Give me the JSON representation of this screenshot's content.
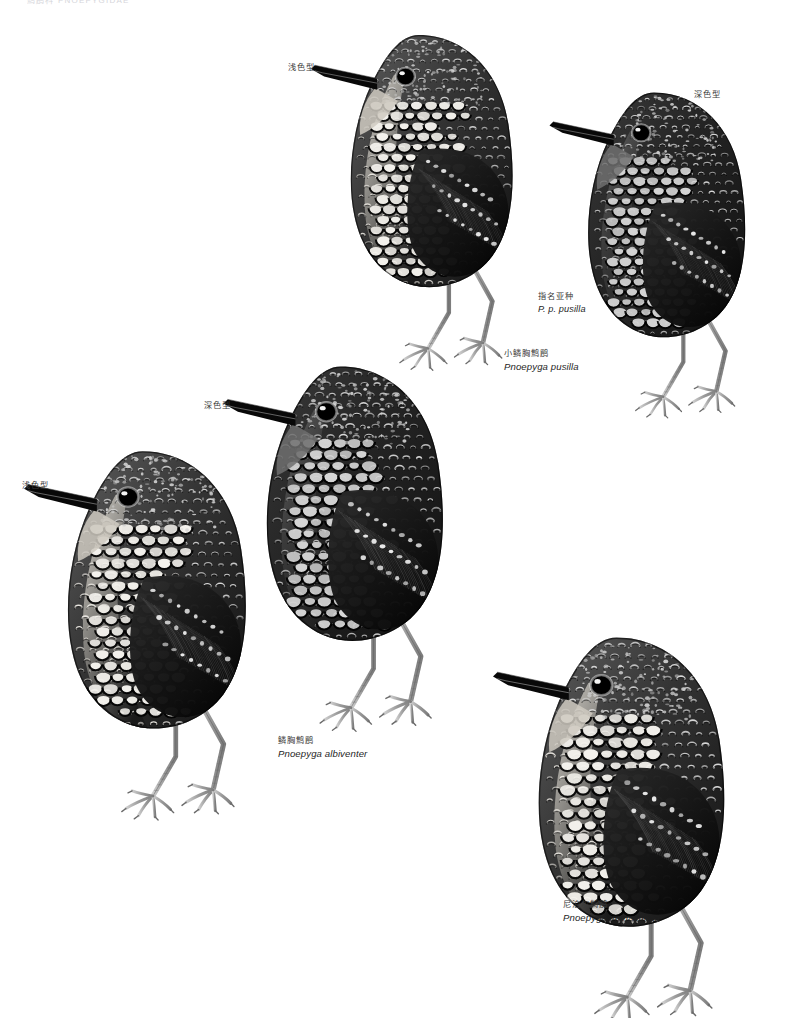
{
  "page": {
    "width": 792,
    "height": 1018,
    "background": "#ffffff",
    "running_header": "鹪鹛科 PNOEPYGIDAE"
  },
  "plate": {
    "type": "field-guide-illustration-plate",
    "medium": "grayscale-scientific-illustration",
    "subject": "wren-babblers (Pnoepyga)",
    "ink_color": "#1a1a1a",
    "leg_color": "#9a9a9a"
  },
  "birds": [
    {
      "id": "pusilla-pale",
      "species_key": "pusilla",
      "morph_label": "浅色型",
      "morph_label_en_meaning": "pale morph",
      "facing": "left",
      "plumage": "pale",
      "position": {
        "left": 300,
        "top": 18,
        "width": 260,
        "height": 340
      },
      "label_position": {
        "left": 288,
        "top": 63
      }
    },
    {
      "id": "pusilla-dark",
      "species_key": "pusilla",
      "morph_label": "深色型",
      "morph_label_en_meaning": "dark morph",
      "facing": "left",
      "plumage": "dark",
      "position": {
        "left": 545,
        "top": 76,
        "width": 240,
        "height": 330
      },
      "label_position": {
        "left": 694,
        "top": 90
      }
    },
    {
      "id": "albiventer-dark",
      "species_key": "albiventer",
      "morph_label": "深色型",
      "morph_label_en_meaning": "dark morph",
      "facing": "left",
      "plumage": "dark",
      "position": {
        "left": 218,
        "top": 348,
        "width": 270,
        "height": 370
      },
      "label_position": {
        "left": 204,
        "top": 401
      }
    },
    {
      "id": "albiventer-pale",
      "species_key": "albiventer",
      "morph_label": "浅色型",
      "morph_label_en_meaning": "pale morph",
      "facing": "left",
      "plumage": "pale",
      "position": {
        "left": 20,
        "top": 432,
        "width": 270,
        "height": 375
      },
      "label_position": {
        "left": 22,
        "top": 481
      }
    },
    {
      "id": "immaculata",
      "species_key": "immaculata",
      "morph_label": "",
      "morph_label_en_meaning": "",
      "facing": "left",
      "plumage": "pale-bellied",
      "position": {
        "left": 487,
        "top": 618,
        "width": 285,
        "height": 390
      },
      "label_position": null
    }
  ],
  "captions": [
    {
      "id": "subspecies-pusilla",
      "chinese": "指名亚种",
      "scientific": "P. p. pusilla",
      "position": {
        "left": 538,
        "top": 291
      },
      "kind": "subspecies"
    },
    {
      "id": "species-pusilla",
      "chinese": "小鳞胸鹪鹛",
      "scientific": "Pnoepyga pusilla",
      "position": {
        "left": 504,
        "top": 348
      },
      "kind": "species"
    },
    {
      "id": "species-albiventer",
      "chinese": "鳞胸鹪鹛",
      "scientific": "Pnoepyga albiventer",
      "position": {
        "left": 278,
        "top": 735
      },
      "kind": "species"
    },
    {
      "id": "species-immaculata",
      "chinese": "尼泊尔鹪鹛",
      "scientific": "Pnoepyga immaculata",
      "position": {
        "left": 563,
        "top": 899
      },
      "kind": "species"
    }
  ]
}
